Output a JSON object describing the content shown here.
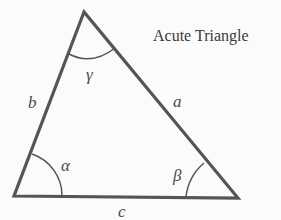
{
  "title": "Acute Triangle",
  "sides": {
    "a": "a",
    "b": "b",
    "c": "c"
  },
  "angles": {
    "alpha": "α",
    "beta": "β",
    "gamma": "γ"
  },
  "colors": {
    "stroke": "#555555",
    "background": "#fbfbfb",
    "text": "#4a4a4a"
  },
  "vertices": {
    "top": [
      84,
      12
    ],
    "left": [
      14,
      196
    ],
    "right": [
      238,
      198
    ]
  }
}
